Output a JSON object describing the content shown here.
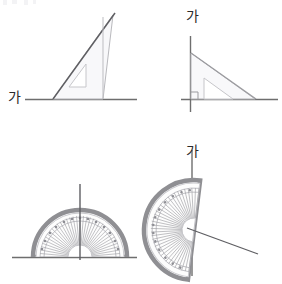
{
  "page": {
    "width": 282,
    "height": 284,
    "background": "#ffffff"
  },
  "colors": {
    "line_dark": "#6e6e6e",
    "line_mid": "#8a8a8a",
    "line_light": "#b9b9bd",
    "ruler_fill": "#f2f2f4",
    "ruler_edge": "#c2c2c6",
    "protractor_rim": "#8f8f93",
    "protractor_body": "#fafafa",
    "protractor_tick": "#9a9aa0",
    "label_text": "#2b2b2b",
    "baseline": "#6e6e6e"
  },
  "figures": [
    {
      "id": "top-left",
      "name": "set-square-on-horizontal-line",
      "label": "가",
      "label_position": "left of horizontal baseline",
      "baseline_orientation": "horizontal",
      "tool": "triangle-ruler",
      "right_angle_marked": false,
      "triangle": {
        "apex": [
          113,
          15
        ],
        "left_vertex": [
          53,
          99
        ],
        "right_vertex": [
          103,
          99
        ],
        "inner_cutout": true
      }
    },
    {
      "id": "top-right",
      "name": "set-square-on-vertical-line",
      "label": "가",
      "label_position": "top of vertical line",
      "baseline_orientation": "vertical-plus-horizontal",
      "tool": "triangle-ruler",
      "right_angle_marked": true,
      "triangle": {
        "apex": [
          190,
          53
        ],
        "corner": [
          190,
          99
        ],
        "right_vertex": [
          255,
          99
        ],
        "inner_cutout": true
      }
    },
    {
      "id": "bottom-left",
      "name": "protractor-on-horizontal-line",
      "label": "가",
      "label_position": "left of horizontal baseline",
      "orientation": "flat-edge-horizontal",
      "center": [
        80,
        257
      ],
      "radius": 47,
      "ray_angle_deg": 90,
      "ray_description": "vertical ray rising from center",
      "scale_divisions": 36
    },
    {
      "id": "bottom-right",
      "name": "protractor-rotated-on-vertical-line",
      "label": "가",
      "label_position": "top of vertical line",
      "orientation": "flat-edge-vertical",
      "center": [
        194,
        230
      ],
      "radius": 50,
      "ray_angle_deg": -22,
      "ray_description": "slanted ray extending down-right from center",
      "scale_divisions": 36
    }
  ],
  "labels": {
    "top_left": "가",
    "top_right": "가",
    "bottom_left": "가",
    "bottom_right": "가"
  }
}
